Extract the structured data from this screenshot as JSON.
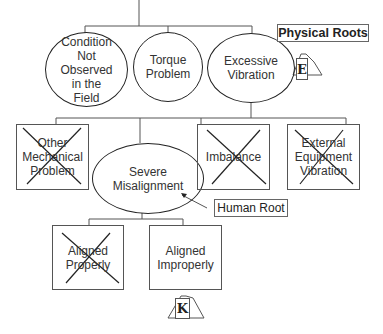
{
  "diagram": {
    "type": "root cause logic tree",
    "labels": {
      "physical_roots": "Physical Roots",
      "human_root": "Human Root"
    },
    "level1": [
      {
        "id": "cond",
        "text": "Condition\nNot\nObserved\nin the\nField",
        "shape": "ellipse",
        "crossed": false
      },
      {
        "id": "torque",
        "text": "Torque\nProblem",
        "shape": "ellipse",
        "crossed": false
      },
      {
        "id": "vib",
        "text": "Excessive\nVibration",
        "shape": "ellipse",
        "crossed": false
      }
    ],
    "level2": [
      {
        "id": "omp",
        "text": "Other\nMechanical\nProblem",
        "shape": "box",
        "crossed": true
      },
      {
        "id": "mis",
        "text": "Severe\nMisalignment",
        "shape": "ellipse",
        "crossed": false
      },
      {
        "id": "imb",
        "text": "Imbalance",
        "shape": "box",
        "crossed": true
      },
      {
        "id": "ext",
        "text": "External\nEquipment\nVibration",
        "shape": "box",
        "crossed": true
      }
    ],
    "level3": [
      {
        "id": "ap",
        "text": "Aligned\nProperly",
        "shape": "box",
        "crossed": true
      },
      {
        "id": "ai",
        "text": "Aligned\nImproperly",
        "shape": "box",
        "crossed": false
      }
    ],
    "connectors": [
      {
        "id": "E",
        "letter": "E"
      },
      {
        "id": "K",
        "letter": "K"
      }
    ]
  }
}
